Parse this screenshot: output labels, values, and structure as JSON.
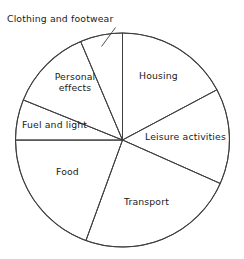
{
  "chart_data": {
    "type": "pie",
    "title": "",
    "subtitle": "",
    "xlabel": "",
    "ylabel": "",
    "legend_position": "none",
    "grid": false,
    "units": "degrees of arc",
    "total_degrees": 360,
    "center": {
      "x": 122.5,
      "y": 140
    },
    "radius": 107,
    "start_angle_deg": 0,
    "direction": "clockwise",
    "categories": [
      "Housing",
      "Leisure activities",
      "Transport",
      "Food",
      "Fuel and light",
      "Personal effects",
      "Clothing and footwear"
    ],
    "values": [
      62,
      52,
      86,
      70,
      22,
      45,
      23
    ],
    "slices": [
      {
        "label": "Housing",
        "start_deg": 0,
        "end_deg": 62,
        "sweep_deg": 62,
        "percent": 17.2,
        "label_placement": "inside"
      },
      {
        "label": "Leisure activities",
        "start_deg": 62,
        "end_deg": 114,
        "sweep_deg": 52,
        "percent": 14.4,
        "label_placement": "inside"
      },
      {
        "label": "Transport",
        "start_deg": 114,
        "end_deg": 200,
        "sweep_deg": 86,
        "percent": 23.9,
        "label_placement": "inside"
      },
      {
        "label": "Food",
        "start_deg": 200,
        "end_deg": 270,
        "sweep_deg": 70,
        "percent": 19.4,
        "label_placement": "inside"
      },
      {
        "label": "Fuel and light",
        "start_deg": 270,
        "end_deg": 292,
        "sweep_deg": 22,
        "percent": 6.1,
        "label_placement": "inside"
      },
      {
        "label": "Personal effects",
        "start_deg": 292,
        "end_deg": 337,
        "sweep_deg": 45,
        "percent": 12.5,
        "label_placement": "inside"
      },
      {
        "label": "Clothing and footwear",
        "start_deg": 337,
        "end_deg": 360,
        "sweep_deg": 23,
        "percent": 6.4,
        "label_placement": "outside-leader"
      }
    ]
  },
  "labels": {
    "housing": "Housing",
    "leisure_activities": "Leisure activities",
    "transport": "Transport",
    "food": "Food",
    "fuel_and_light": "Fuel and light",
    "personal_effects_line1": "Personal",
    "personal_effects_line2": "effects",
    "clothing_and_footwear": "Clothing and footwear"
  },
  "colors": {
    "background": "#ffffff",
    "slice_fill": "#ffffff",
    "stroke": "#3d3d3d",
    "text": "#1a1a1a"
  }
}
